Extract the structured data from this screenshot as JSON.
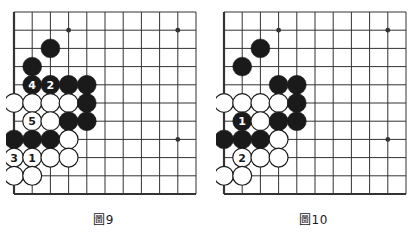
{
  "page": {
    "background": "#ffffff",
    "board_line_color": "#333333",
    "black_stone_color": "#1a1a1a",
    "white_stone_color": "#ffffff",
    "white_stone_border": "#1a1a1a",
    "black_label_color": "#ffffff",
    "white_label_color": "#1a1a1a"
  },
  "diagrams": [
    {
      "id": "figure-9",
      "caption": "圖9",
      "grid": {
        "cols": 11,
        "rows": 11,
        "spacing": 18.2,
        "origin_x": 8,
        "origin_y": 8,
        "edge_left": true,
        "edge_bottom": true
      },
      "star_points": [
        {
          "col": 3,
          "row": 1
        },
        {
          "col": 9,
          "row": 1
        },
        {
          "col": 9,
          "row": 7
        }
      ],
      "stones": [
        {
          "col": 2,
          "row": 2,
          "color": "black",
          "label": ""
        },
        {
          "col": 1,
          "row": 3,
          "color": "black",
          "label": ""
        },
        {
          "col": 1,
          "row": 4,
          "color": "black",
          "label": "4"
        },
        {
          "col": 2,
          "row": 4,
          "color": "black",
          "label": "2"
        },
        {
          "col": 3,
          "row": 4,
          "color": "black",
          "label": ""
        },
        {
          "col": 4,
          "row": 4,
          "color": "black",
          "label": ""
        },
        {
          "col": 0,
          "row": 5,
          "color": "white",
          "label": ""
        },
        {
          "col": 1,
          "row": 5,
          "color": "white",
          "label": ""
        },
        {
          "col": 2,
          "row": 5,
          "color": "white",
          "label": ""
        },
        {
          "col": 3,
          "row": 5,
          "color": "white",
          "label": ""
        },
        {
          "col": 4,
          "row": 5,
          "color": "black",
          "label": ""
        },
        {
          "col": 1,
          "row": 6,
          "color": "white",
          "label": "5"
        },
        {
          "col": 2,
          "row": 6,
          "color": "white",
          "label": ""
        },
        {
          "col": 3,
          "row": 6,
          "color": "black",
          "label": ""
        },
        {
          "col": 4,
          "row": 6,
          "color": "black",
          "label": ""
        },
        {
          "col": 0,
          "row": 7,
          "color": "black",
          "label": ""
        },
        {
          "col": 1,
          "row": 7,
          "color": "black",
          "label": ""
        },
        {
          "col": 2,
          "row": 7,
          "color": "black",
          "label": ""
        },
        {
          "col": 3,
          "row": 7,
          "color": "white",
          "label": ""
        },
        {
          "col": 0,
          "row": 8,
          "color": "white",
          "label": "3"
        },
        {
          "col": 1,
          "row": 8,
          "color": "white",
          "label": "1"
        },
        {
          "col": 2,
          "row": 8,
          "color": "white",
          "label": ""
        },
        {
          "col": 3,
          "row": 8,
          "color": "white",
          "label": ""
        },
        {
          "col": 0,
          "row": 9,
          "color": "white",
          "label": ""
        },
        {
          "col": 1,
          "row": 9,
          "color": "white",
          "label": ""
        }
      ]
    },
    {
      "id": "figure-10",
      "caption": "圖10",
      "grid": {
        "cols": 11,
        "rows": 11,
        "spacing": 18.2,
        "origin_x": 8,
        "origin_y": 8,
        "edge_left": true,
        "edge_bottom": true
      },
      "star_points": [
        {
          "col": 3,
          "row": 1
        },
        {
          "col": 9,
          "row": 1
        },
        {
          "col": 9,
          "row": 7
        }
      ],
      "stones": [
        {
          "col": 2,
          "row": 2,
          "color": "black",
          "label": ""
        },
        {
          "col": 1,
          "row": 3,
          "color": "black",
          "label": ""
        },
        {
          "col": 3,
          "row": 4,
          "color": "black",
          "label": ""
        },
        {
          "col": 4,
          "row": 4,
          "color": "black",
          "label": ""
        },
        {
          "col": 0,
          "row": 5,
          "color": "white",
          "label": ""
        },
        {
          "col": 1,
          "row": 5,
          "color": "white",
          "label": ""
        },
        {
          "col": 2,
          "row": 5,
          "color": "white",
          "label": ""
        },
        {
          "col": 3,
          "row": 5,
          "color": "white",
          "label": ""
        },
        {
          "col": 4,
          "row": 5,
          "color": "black",
          "label": ""
        },
        {
          "col": 1,
          "row": 6,
          "color": "black",
          "label": "1"
        },
        {
          "col": 2,
          "row": 6,
          "color": "white",
          "label": ""
        },
        {
          "col": 3,
          "row": 6,
          "color": "black",
          "label": ""
        },
        {
          "col": 4,
          "row": 6,
          "color": "black",
          "label": ""
        },
        {
          "col": 0,
          "row": 7,
          "color": "black",
          "label": ""
        },
        {
          "col": 1,
          "row": 7,
          "color": "black",
          "label": ""
        },
        {
          "col": 2,
          "row": 7,
          "color": "black",
          "label": ""
        },
        {
          "col": 3,
          "row": 7,
          "color": "white",
          "label": ""
        },
        {
          "col": 1,
          "row": 8,
          "color": "white",
          "label": "2"
        },
        {
          "col": 2,
          "row": 8,
          "color": "white",
          "label": ""
        },
        {
          "col": 3,
          "row": 8,
          "color": "white",
          "label": ""
        },
        {
          "col": 0,
          "row": 9,
          "color": "white",
          "label": ""
        },
        {
          "col": 1,
          "row": 9,
          "color": "white",
          "label": ""
        }
      ]
    }
  ]
}
